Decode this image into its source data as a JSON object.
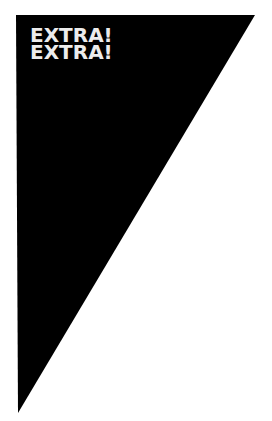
{
  "headline": {
    "line1": "EXTRA!",
    "line2": "EXTRA!"
  },
  "colors": {
    "background": "#ffffff",
    "shape": "#000000",
    "text": "#ececec"
  }
}
